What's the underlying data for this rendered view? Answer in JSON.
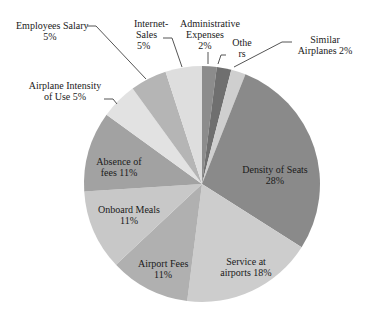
{
  "chart_data": {
    "type": "pie",
    "title": "",
    "start_angle_deg": 0,
    "direction": "clockwise",
    "slices": [
      {
        "label": "Administrative Expenses",
        "value": 2,
        "display": "2%",
        "color": "#8c8c8c"
      },
      {
        "label": "Others",
        "value": 2,
        "display": "",
        "color": "#6f6f6f"
      },
      {
        "label": "Similar Airplanes",
        "value": 2,
        "display": "2%",
        "color": "#cfcfcf"
      },
      {
        "label": "Density of Seats",
        "value": 28,
        "display": "28%",
        "color": "#8a8a8a"
      },
      {
        "label": "Service at airports",
        "value": 18,
        "display": "18%",
        "color": "#cdcdcd"
      },
      {
        "label": "Airport Fees",
        "value": 11,
        "display": "11%",
        "color": "#b0b0b0"
      },
      {
        "label": "Onboard Meals",
        "value": 11,
        "display": "11%",
        "color": "#c8c8c8"
      },
      {
        "label": "Absence of fees",
        "value": 11,
        "display": "11%",
        "color": "#a2a2a2"
      },
      {
        "label": "Airplane Intensity of Use",
        "value": 5,
        "display": "5%",
        "color": "#e2e2e2"
      },
      {
        "label": "Employees Salary",
        "value": 5,
        "display": "5%",
        "color": "#b5b5b5"
      },
      {
        "label": "Internet Sales",
        "value": 5,
        "display": "5%",
        "color": "#dedede"
      }
    ],
    "legend": "none",
    "data_labels": "outside with leader lines for small slices, inside for large slices"
  },
  "labels": {
    "admin_line1": "Administrative",
    "admin_line2": "Expenses",
    "admin_pct": "2%",
    "others_line1": "Othe",
    "others_line2": "rs",
    "similar_line1": "Similar",
    "similar_line2": "Airplanes  2%",
    "density_line1": "Density of Seats",
    "density_pct": "28%",
    "service_line1": "Service at",
    "service_line2": "airports 18%",
    "airport_fees_line1": "Airport Fees",
    "airport_fees_pct": "11%",
    "onboard_line1": "Onboard Meals",
    "onboard_pct": "11%",
    "absence_line1": "Absence  of",
    "absence_line2": "fees 11%",
    "intensity_line1": "Airplane Intensity",
    "intensity_line2": "of Use 5%",
    "salary_line1": "Employees Salary",
    "salary_pct": "5%",
    "internet_line1": "Internet-",
    "internet_line2": "Sales",
    "internet_pct": "5%"
  }
}
